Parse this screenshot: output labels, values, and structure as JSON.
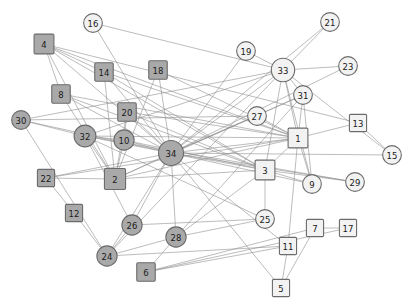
{
  "figure": {
    "title": "",
    "background_color": "#ffffff",
    "edge_color": "#8e8e8e",
    "node_stroke_color": "#6b6b6b",
    "label_color": "#1a1a1a",
    "community_colors": {
      "dark": "#a9a9a9",
      "light": "#f2f2f2"
    }
  },
  "chart_data": {
    "type": "scatter",
    "title": "",
    "xlabel": "",
    "ylabel": "",
    "grid": false,
    "legend": "none",
    "graph_kind": "node-link-network",
    "node_count": 34,
    "edge_count": 78,
    "shapes": [
      "square",
      "circle"
    ],
    "groups": [
      "dark",
      "light"
    ],
    "nodes": [
      {
        "id": "1",
        "label": "1",
        "x": 298,
        "y": 138,
        "shape": "square",
        "group": "light",
        "size": 15
      },
      {
        "id": "2",
        "label": "2",
        "x": 115,
        "y": 179,
        "shape": "square",
        "group": "dark",
        "size": 16
      },
      {
        "id": "3",
        "label": "3",
        "x": 265,
        "y": 170,
        "shape": "square",
        "group": "light",
        "size": 15
      },
      {
        "id": "4",
        "label": "4",
        "x": 44,
        "y": 44,
        "shape": "square",
        "group": "dark",
        "size": 15
      },
      {
        "id": "5",
        "label": "5",
        "x": 281,
        "y": 288,
        "shape": "square",
        "group": "light",
        "size": 13
      },
      {
        "id": "6",
        "label": "6",
        "x": 146,
        "y": 272,
        "shape": "square",
        "group": "dark",
        "size": 14
      },
      {
        "id": "7",
        "label": "7",
        "x": 315,
        "y": 228,
        "shape": "square",
        "group": "light",
        "size": 13
      },
      {
        "id": "8",
        "label": "8",
        "x": 61,
        "y": 94,
        "shape": "square",
        "group": "dark",
        "size": 14
      },
      {
        "id": "9",
        "label": "9",
        "x": 312,
        "y": 184,
        "shape": "circle",
        "group": "light",
        "size": 12
      },
      {
        "id": "10",
        "label": "10",
        "x": 124,
        "y": 140,
        "shape": "circle",
        "group": "dark",
        "size": 13
      },
      {
        "id": "11",
        "label": "11",
        "x": 288,
        "y": 246,
        "shape": "square",
        "group": "light",
        "size": 13
      },
      {
        "id": "12",
        "label": "12",
        "x": 74,
        "y": 213,
        "shape": "square",
        "group": "dark",
        "size": 13
      },
      {
        "id": "13",
        "label": "13",
        "x": 358,
        "y": 123,
        "shape": "square",
        "group": "light",
        "size": 13
      },
      {
        "id": "14",
        "label": "14",
        "x": 104,
        "y": 72,
        "shape": "square",
        "group": "dark",
        "size": 14
      },
      {
        "id": "15",
        "label": "15",
        "x": 392,
        "y": 155,
        "shape": "circle",
        "group": "light",
        "size": 12
      },
      {
        "id": "16",
        "label": "16",
        "x": 93,
        "y": 23,
        "shape": "circle",
        "group": "light",
        "size": 12
      },
      {
        "id": "17",
        "label": "17",
        "x": 348,
        "y": 228,
        "shape": "square",
        "group": "light",
        "size": 13
      },
      {
        "id": "18",
        "label": "18",
        "x": 158,
        "y": 70,
        "shape": "square",
        "group": "dark",
        "size": 14
      },
      {
        "id": "19",
        "label": "19",
        "x": 246,
        "y": 51,
        "shape": "circle",
        "group": "light",
        "size": 12
      },
      {
        "id": "20",
        "label": "20",
        "x": 127,
        "y": 112,
        "shape": "square",
        "group": "dark",
        "size": 14
      },
      {
        "id": "21",
        "label": "21",
        "x": 330,
        "y": 22,
        "shape": "circle",
        "group": "light",
        "size": 12
      },
      {
        "id": "22",
        "label": "22",
        "x": 46,
        "y": 178,
        "shape": "square",
        "group": "dark",
        "size": 13
      },
      {
        "id": "23",
        "label": "23",
        "x": 348,
        "y": 66,
        "shape": "circle",
        "group": "light",
        "size": 12
      },
      {
        "id": "24",
        "label": "24",
        "x": 107,
        "y": 256,
        "shape": "circle",
        "group": "dark",
        "size": 13
      },
      {
        "id": "25",
        "label": "25",
        "x": 265,
        "y": 219,
        "shape": "circle",
        "group": "light",
        "size": 12
      },
      {
        "id": "26",
        "label": "26",
        "x": 132,
        "y": 225,
        "shape": "circle",
        "group": "dark",
        "size": 13
      },
      {
        "id": "27",
        "label": "27",
        "x": 257,
        "y": 116,
        "shape": "circle",
        "group": "light",
        "size": 12
      },
      {
        "id": "28",
        "label": "28",
        "x": 176,
        "y": 237,
        "shape": "circle",
        "group": "dark",
        "size": 13
      },
      {
        "id": "29",
        "label": "29",
        "x": 355,
        "y": 182,
        "shape": "circle",
        "group": "light",
        "size": 12
      },
      {
        "id": "30",
        "label": "30",
        "x": 21,
        "y": 120,
        "shape": "circle",
        "group": "dark",
        "size": 12
      },
      {
        "id": "31",
        "label": "31",
        "x": 303,
        "y": 95,
        "shape": "circle",
        "group": "light",
        "size": 12
      },
      {
        "id": "32",
        "label": "32",
        "x": 85,
        "y": 136,
        "shape": "circle",
        "group": "dark",
        "size": 14
      },
      {
        "id": "33",
        "label": "33",
        "x": 283,
        "y": 70,
        "shape": "circle",
        "group": "light",
        "size": 15
      },
      {
        "id": "34",
        "label": "34",
        "x": 171,
        "y": 153,
        "shape": "circle",
        "group": "dark",
        "size": 16
      }
    ],
    "edges": [
      [
        "1",
        "2"
      ],
      [
        "1",
        "3"
      ],
      [
        "1",
        "4"
      ],
      [
        "1",
        "8"
      ],
      [
        "1",
        "9"
      ],
      [
        "1",
        "13"
      ],
      [
        "1",
        "14"
      ],
      [
        "1",
        "18"
      ],
      [
        "1",
        "20"
      ],
      [
        "1",
        "22"
      ],
      [
        "1",
        "31"
      ],
      [
        "1",
        "32"
      ],
      [
        "1",
        "33"
      ],
      [
        "1",
        "34"
      ],
      [
        "2",
        "3"
      ],
      [
        "2",
        "4"
      ],
      [
        "2",
        "8"
      ],
      [
        "2",
        "14"
      ],
      [
        "2",
        "18"
      ],
      [
        "2",
        "20"
      ],
      [
        "2",
        "22"
      ],
      [
        "2",
        "31"
      ],
      [
        "2",
        "32"
      ],
      [
        "2",
        "34"
      ],
      [
        "3",
        "4"
      ],
      [
        "3",
        "8"
      ],
      [
        "3",
        "9"
      ],
      [
        "3",
        "10"
      ],
      [
        "3",
        "14"
      ],
      [
        "3",
        "28"
      ],
      [
        "3",
        "29"
      ],
      [
        "3",
        "33"
      ],
      [
        "3",
        "34"
      ],
      [
        "4",
        "8"
      ],
      [
        "4",
        "13"
      ],
      [
        "4",
        "14"
      ],
      [
        "5",
        "7"
      ],
      [
        "5",
        "11"
      ],
      [
        "6",
        "7"
      ],
      [
        "6",
        "11"
      ],
      [
        "6",
        "17"
      ],
      [
        "7",
        "17"
      ],
      [
        "9",
        "31"
      ],
      [
        "9",
        "33"
      ],
      [
        "9",
        "34"
      ],
      [
        "10",
        "34"
      ],
      [
        "14",
        "34"
      ],
      [
        "15",
        "33"
      ],
      [
        "15",
        "34"
      ],
      [
        "16",
        "33"
      ],
      [
        "16",
        "34"
      ],
      [
        "19",
        "33"
      ],
      [
        "19",
        "34"
      ],
      [
        "20",
        "34"
      ],
      [
        "21",
        "33"
      ],
      [
        "21",
        "34"
      ],
      [
        "23",
        "33"
      ],
      [
        "23",
        "34"
      ],
      [
        "24",
        "26"
      ],
      [
        "24",
        "28"
      ],
      [
        "24",
        "30"
      ],
      [
        "24",
        "33"
      ],
      [
        "24",
        "34"
      ],
      [
        "25",
        "26"
      ],
      [
        "25",
        "28"
      ],
      [
        "25",
        "32"
      ],
      [
        "26",
        "24"
      ],
      [
        "26",
        "32"
      ],
      [
        "27",
        "30"
      ],
      [
        "27",
        "34"
      ],
      [
        "28",
        "34"
      ],
      [
        "29",
        "32"
      ],
      [
        "29",
        "34"
      ],
      [
        "30",
        "33"
      ],
      [
        "30",
        "34"
      ],
      [
        "31",
        "33"
      ],
      [
        "31",
        "34"
      ],
      [
        "32",
        "33"
      ],
      [
        "32",
        "34"
      ],
      [
        "33",
        "34"
      ],
      [
        "12",
        "24"
      ],
      [
        "12",
        "22"
      ],
      [
        "10",
        "32"
      ],
      [
        "10",
        "2"
      ],
      [
        "10",
        "20"
      ],
      [
        "26",
        "34"
      ],
      [
        "28",
        "31"
      ],
      [
        "27",
        "1"
      ],
      [
        "11",
        "34"
      ],
      [
        "11",
        "1"
      ],
      [
        "5",
        "34"
      ],
      [
        "18",
        "34"
      ],
      [
        "8",
        "34"
      ],
      [
        "4",
        "34"
      ],
      [
        "22",
        "34"
      ],
      [
        "6",
        "28"
      ],
      [
        "13",
        "15"
      ],
      [
        "20",
        "3"
      ],
      [
        "32",
        "2"
      ],
      [
        "16",
        "34"
      ],
      [
        "30",
        "32"
      ],
      [
        "24",
        "11"
      ],
      [
        "3",
        "25"
      ]
    ]
  }
}
